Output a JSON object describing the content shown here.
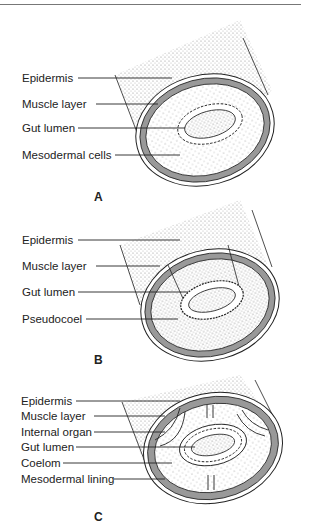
{
  "panels": [
    {
      "letter": "A",
      "labels": [
        "Epidermis",
        "Muscle layer",
        "Gut lumen",
        "Mesodermal cells"
      ]
    },
    {
      "letter": "B",
      "labels": [
        "Epidermis",
        "Muscle layer",
        "Gut lumen",
        "Pseudocoel"
      ]
    },
    {
      "letter": "C",
      "labels": [
        "Epidermis",
        "Muscle layer",
        "Internal organ",
        "Gut lumen",
        "Coelom",
        "Mesodermal lining"
      ]
    }
  ],
  "colors": {
    "muscle": "#9a9a9a",
    "line": "#222222",
    "stipple": "#bbbbbb"
  }
}
